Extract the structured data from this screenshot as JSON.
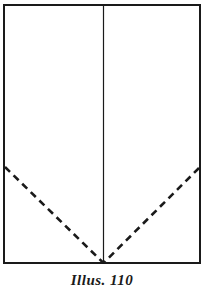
{
  "figure": {
    "caption": "Illus. 110",
    "colors": {
      "ink": "#1a1a1a",
      "paper": "#ffffff",
      "fold_line": "#1a1a1a"
    },
    "sheet": {
      "name": "paper-sheet-outline",
      "x": 4,
      "y": 5,
      "width": 196,
      "height": 258,
      "stroke_width": 2.6
    },
    "center_fold": {
      "name": "vertical-center-fold-line",
      "x": 103.5,
      "y_top": 5,
      "y_bottom": 263,
      "stroke_width": 1.2,
      "style": "solid"
    },
    "fold_left": {
      "name": "left-diagonal-fold-line",
      "x1": 5,
      "y1": 167,
      "x2": 103.5,
      "y2": 263,
      "stroke_width": 2.6,
      "style": "dashed",
      "dash": "7 5"
    },
    "fold_right": {
      "name": "right-diagonal-fold-line",
      "x1": 199,
      "y1": 168,
      "x2": 103.5,
      "y2": 263,
      "stroke_width": 2.6,
      "style": "dashed",
      "dash": "7 5"
    }
  }
}
